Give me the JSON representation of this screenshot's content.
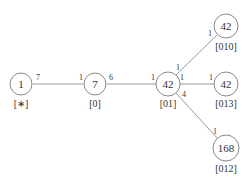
{
  "diagram": {
    "nodes": [
      {
        "id": "n1",
        "value": "1",
        "label": "[∗]"
      },
      {
        "id": "n2",
        "value": "7",
        "label": "[0]"
      },
      {
        "id": "n3",
        "value": "42",
        "label": "[01]"
      },
      {
        "id": "n4",
        "value": "42",
        "label": "[010]"
      },
      {
        "id": "n5",
        "value": "42",
        "label": "[013]"
      },
      {
        "id": "n6",
        "value": "168",
        "label": "[012]"
      }
    ],
    "edges": [
      {
        "from": "n1",
        "to": "n2",
        "w_from": "7",
        "w_to": "1"
      },
      {
        "from": "n2",
        "to": "n3",
        "w_from": "6",
        "w_to": "1"
      },
      {
        "from": "n3",
        "to": "n4",
        "w_from": "1",
        "w_to": "1"
      },
      {
        "from": "n3",
        "to": "n5",
        "w_from": "1",
        "w_to": "1"
      },
      {
        "from": "n3",
        "to": "n6",
        "w_from": "4",
        "w_to": "1"
      }
    ]
  }
}
